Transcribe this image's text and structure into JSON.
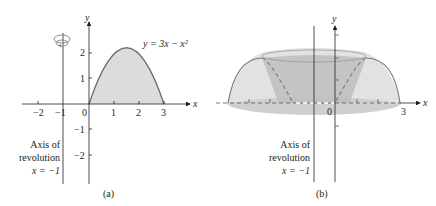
{
  "panel_a": {
    "caption": "(a)",
    "axis_x_label": "x",
    "axis_y_label": "y",
    "x_ticks": [
      "−2",
      "−1",
      "0",
      "1",
      "2",
      "3"
    ],
    "y_ticks_pos": [
      "1",
      "2"
    ],
    "y_ticks_neg": [
      "−1",
      "−2"
    ],
    "curve_label": "y = 3x − x²",
    "axis_note": {
      "line1": "Axis of",
      "line2": "revolution",
      "line3": "x = −1"
    },
    "rotation_icon": "rotation-arrow-icon"
  },
  "panel_b": {
    "caption": "(b)",
    "axis_x_label": "x",
    "axis_y_label": "y",
    "origin_label": "0",
    "x_end_label": "3",
    "axis_note": {
      "line1": "Axis of",
      "line2": "revolution",
      "line3": "x = −1"
    }
  },
  "colors": {
    "ink": "#231f20",
    "region_fill": "#d9d9d9",
    "solid_fill": "#c8c8c8",
    "solid_light": "#e3e3e3",
    "solid_edge": "#7a7a7a"
  }
}
